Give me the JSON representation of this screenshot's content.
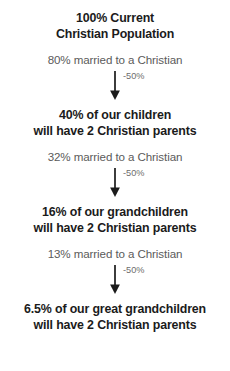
{
  "diagram": {
    "type": "vertical-flow",
    "background_color": "#ffffff",
    "heading_color": "#1b1b1b",
    "subtext_color": "#5b5b5b",
    "label_color": "#6d6d6d",
    "arrow_color": "#1b1b1b",
    "generations": [
      {
        "heading": "100% Current\nChristian Population",
        "subtext": "80% married to a Christian"
      },
      {
        "heading": "40% of our children\nwill have 2 Christian parents",
        "subtext": "32% married to a Christian"
      },
      {
        "heading": "16% of our grandchildren\nwill have 2 Christian parents",
        "subtext": "13% married to a Christian"
      },
      {
        "heading": "6.5% of our great grandchildren\nwill have 2 Christian parents",
        "subtext": ""
      }
    ],
    "connectors": [
      {
        "label": "-50%"
      },
      {
        "label": "-50%"
      },
      {
        "label": "-50%"
      }
    ]
  }
}
